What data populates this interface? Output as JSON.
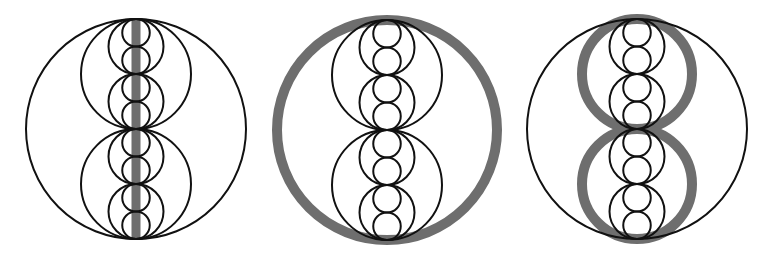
{
  "diagram": {
    "colors": {
      "background": "#ffffff",
      "stroke": "#111111",
      "highlight": "#6e6e6e"
    },
    "geometry": {
      "big_radius": 110,
      "medium_radius": 55,
      "small_radius": 27.5,
      "tiny_radius": 13.75,
      "line_width": 2,
      "highlight_width": 9
    },
    "panels": [
      {
        "id": "panel-1",
        "cx": 136,
        "cy": 129,
        "highlight": "vertical-diameter"
      },
      {
        "id": "panel-2",
        "cx": 387,
        "cy": 130,
        "highlight": "big-circle"
      },
      {
        "id": "panel-3",
        "cx": 637,
        "cy": 129,
        "highlight": "medium-circles"
      }
    ]
  }
}
